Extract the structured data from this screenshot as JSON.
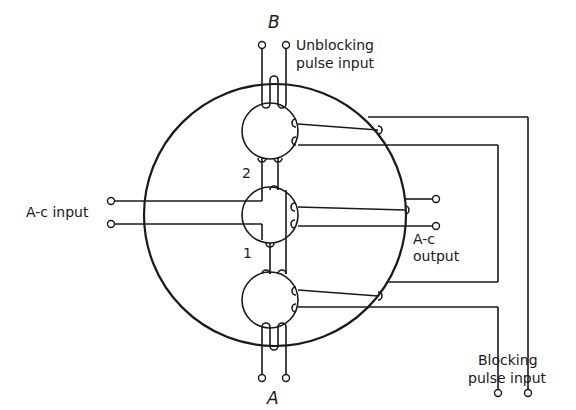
{
  "figure": {
    "type": "circuit-diagram"
  },
  "labels": {
    "terminal_b": "B",
    "terminal_a": "A",
    "unblocking_line1": "Unblocking",
    "unblocking_line2": "pulse input",
    "ac_input": "A-c input",
    "ac_output_line1": "A-c",
    "ac_output_line2": "output",
    "blocking_line1": "Blocking",
    "blocking_line2": "pulse input",
    "leg_2": "2",
    "leg_1": "1"
  },
  "components": {
    "core": {
      "shape": "circle",
      "cx": 275,
      "cy": 215,
      "r": 131
    },
    "apertures": [
      {
        "id": "top",
        "cx": 270,
        "cy": 131,
        "r": 28
      },
      {
        "id": "middle",
        "cx": 270,
        "cy": 215,
        "r": 28
      },
      {
        "id": "bottom",
        "cx": 270,
        "cy": 300,
        "r": 28
      }
    ]
  },
  "colors": {
    "line": "#1a1a1a",
    "background": "#ffffff"
  }
}
